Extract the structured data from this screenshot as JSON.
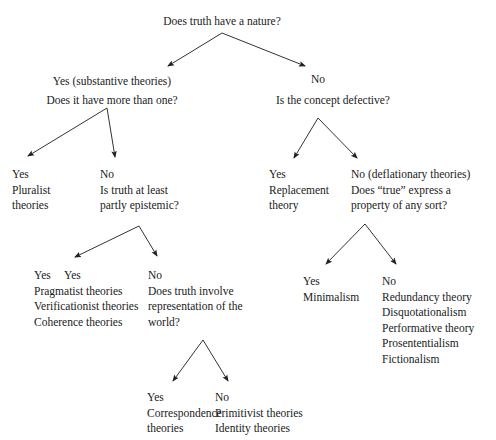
{
  "diagram": {
    "title_text": "Does truth have a nature?",
    "type": "decision-tree",
    "background_color": "#ffffff",
    "line_color": "#333333",
    "text_color": "#1a1a1a",
    "nodes": [
      {
        "id": "root-question",
        "text": "Does truth have a nature?",
        "x": 222,
        "y": 14,
        "align": "center"
      },
      {
        "id": "yes-substantive-label",
        "text": "Yes (substantive theories)",
        "x": 112,
        "y": 74,
        "align": "center"
      },
      {
        "id": "more-than-one-question",
        "text": "Does it have more than one?",
        "x": 112,
        "y": 93,
        "align": "center"
      },
      {
        "id": "no-label-top",
        "text": "No",
        "x": 311,
        "y": 72,
        "align": "left"
      },
      {
        "id": "concept-defective-question",
        "text": "Is the concept defective?",
        "x": 276,
        "y": 93,
        "align": "left"
      },
      {
        "id": "yes-pluralist",
        "text": "Yes\nPluralist\ntheories",
        "x": 12,
        "y": 167,
        "align": "left"
      },
      {
        "id": "no-epistemic-question",
        "text": "No\nIs truth at least\npartly epistemic?",
        "x": 100,
        "y": 167,
        "align": "left"
      },
      {
        "id": "yes-replacement",
        "text": "Yes\nReplacement\ntheory",
        "x": 269,
        "y": 167,
        "align": "left"
      },
      {
        "id": "no-deflationary-question",
        "text": "No (deflationary theories)\nDoes “true” express a\nproperty of any sort?",
        "x": 351,
        "y": 167,
        "align": "left"
      },
      {
        "id": "yes-pragmatist-list",
        "text": "Yes\nPragmatist theories\nVerificationist theories\nCoherence theories",
        "x": 34,
        "y": 268,
        "align": "left"
      },
      {
        "id": "yes-pragmatist-label-pos",
        "text": "Yes",
        "x": 64,
        "y": 268,
        "align": "left"
      },
      {
        "id": "no-representation-question",
        "text": "No\nDoes truth involve\nrepresentation of the\nworld?",
        "x": 148,
        "y": 268,
        "align": "left"
      },
      {
        "id": "yes-minimalism",
        "text": "Yes\nMinimalism",
        "x": 303,
        "y": 274,
        "align": "left"
      },
      {
        "id": "no-deflationary-list",
        "text": "No\nRedundancy theory\nDisquotationalism\nPerformative theory\nProsententialism\nFictionalism",
        "x": 382,
        "y": 274,
        "align": "left"
      },
      {
        "id": "yes-correspondence",
        "text": "Yes\nCorrespondence\ntheories",
        "x": 147,
        "y": 390,
        "align": "left"
      },
      {
        "id": "no-primitivist-list",
        "text": "No\nPrimitivist theories\nIdentity theories",
        "x": 215,
        "y": 390,
        "align": "left"
      }
    ],
    "arrows": [
      {
        "id": "root-to-yes",
        "from_label": "Does truth have a nature?",
        "to_label": "Yes (substantive theories)",
        "x1": 222,
        "y1": 33,
        "x2": 168,
        "y2": 66
      },
      {
        "id": "root-to-no",
        "from_label": "Does truth have a nature?",
        "to_label": "No",
        "x1": 222,
        "y1": 33,
        "x2": 305,
        "y2": 66
      },
      {
        "id": "morethanone-to-yes",
        "from_label": "Does it have more than one?",
        "to_label": "Yes (Pluralist theories)",
        "x1": 107,
        "y1": 108,
        "x2": 28,
        "y2": 156
      },
      {
        "id": "morethanone-to-no",
        "from_label": "Does it have more than one?",
        "to_label": "No (Is truth at least partly epistemic?)",
        "x1": 107,
        "y1": 108,
        "x2": 115,
        "y2": 157
      },
      {
        "id": "defective-to-yes",
        "from_label": "Is the concept defective?",
        "to_label": "Yes (Replacement theory)",
        "x1": 318,
        "y1": 118,
        "x2": 294,
        "y2": 158
      },
      {
        "id": "defective-to-no",
        "from_label": "Is the concept defective?",
        "to_label": "No (deflationary theories)",
        "x1": 318,
        "y1": 118,
        "x2": 357,
        "y2": 158
      },
      {
        "id": "epistemic-to-yes",
        "from_label": "Is truth at least partly epistemic?",
        "to_label": "Yes (Pragmatist theories)",
        "x1": 139,
        "y1": 226,
        "x2": 75,
        "y2": 257
      },
      {
        "id": "epistemic-to-no",
        "from_label": "Is truth at least partly epistemic?",
        "to_label": "No (Does truth involve representation of the world?)",
        "x1": 139,
        "y1": 226,
        "x2": 157,
        "y2": 256
      },
      {
        "id": "property-to-yes",
        "from_label": "Does “true” express a property of any sort?",
        "to_label": "Yes (Minimalism)",
        "x1": 365,
        "y1": 224,
        "x2": 326,
        "y2": 264
      },
      {
        "id": "property-to-no",
        "from_label": "Does “true” express a property of any sort?",
        "to_label": "No (Redundancy theory ...)",
        "x1": 365,
        "y1": 224,
        "x2": 396,
        "y2": 264
      },
      {
        "id": "representation-to-yes",
        "from_label": "Does truth involve representation of the world?",
        "to_label": "Yes (Correspondence theories)",
        "x1": 203,
        "y1": 340,
        "x2": 173,
        "y2": 381
      },
      {
        "id": "representation-to-no",
        "from_label": "Does truth involve representation of the world?",
        "to_label": "No (Primitivist theories)",
        "x1": 203,
        "y1": 340,
        "x2": 228,
        "y2": 381
      }
    ]
  }
}
